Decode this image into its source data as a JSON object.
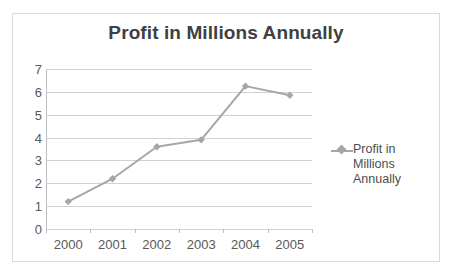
{
  "chart_data": {
    "type": "line",
    "title": "Profit in Millions Annually",
    "xlabel": "",
    "ylabel": "",
    "categories": [
      "2000",
      "2001",
      "2002",
      "2003",
      "2004",
      "2005"
    ],
    "series": [
      {
        "name": "Profit in Millions Annually",
        "values": [
          1.2,
          2.2,
          3.6,
          3.9,
          6.25,
          5.85
        ],
        "color": "#a6a6a6",
        "marker": "diamond"
      }
    ],
    "ylim": [
      0,
      7
    ],
    "ytick_step": 1,
    "yticks": [
      "7",
      "6",
      "5",
      "4",
      "3",
      "2",
      "1",
      "0"
    ],
    "grid": true,
    "grid_axis": "y",
    "legend": {
      "position": "right",
      "entries": [
        "Profit in Millions Annually"
      ],
      "marker_icon": "diamond-marker-icon"
    },
    "colors": {
      "series": "#a6a6a6",
      "title": "#404040",
      "tick_label": "#595959",
      "gridline": "#d2d2d2",
      "axis_line": "#bfbfbf",
      "border": "#d9d9d9",
      "background": "#ffffff"
    }
  }
}
